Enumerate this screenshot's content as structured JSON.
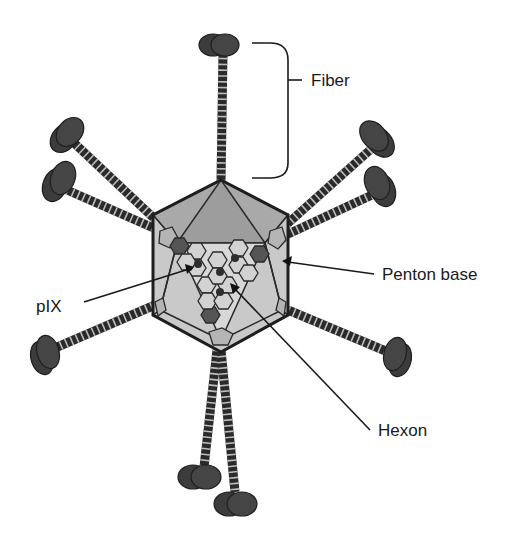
{
  "figure": {
    "labels": {
      "fiber": "Fiber",
      "penton_base": "Penton base",
      "pix": "pIX",
      "hexon": "Hexon"
    },
    "colors": {
      "background": "#ffffff",
      "fiber_knob": "#3c3c3c",
      "fiber_shaft": "#2a2a2a",
      "capsid_face_dark": "#a9a9a9",
      "capsid_face_light": "#d8d8d8",
      "hexon_light": "#d2d2d2",
      "hexon_dark": "#555555",
      "text": "#1a1a1a"
    }
  }
}
